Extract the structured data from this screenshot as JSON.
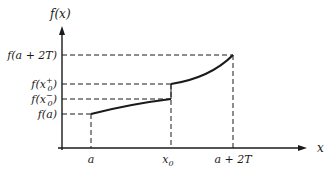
{
  "diagram": {
    "y_axis_label": "f(x)",
    "x_axis_label": "x",
    "y_tick_labels": {
      "f_a2T": "f(a + 2T)",
      "f_x0_plus": "f(x",
      "f_x0_plus_sub": "0",
      "f_x0_plus_sup": "+",
      "f_x0_minus": "f(x",
      "f_x0_minus_sub": "0",
      "f_x0_minus_sup": "−",
      "f_a": "f(a)"
    },
    "x_tick_labels": {
      "a": "a",
      "x0": "x",
      "x0_sub": "0",
      "a2T": "a + 2T"
    },
    "colors": {
      "ink": "#1a1a1a",
      "background": "#ffffff"
    }
  }
}
